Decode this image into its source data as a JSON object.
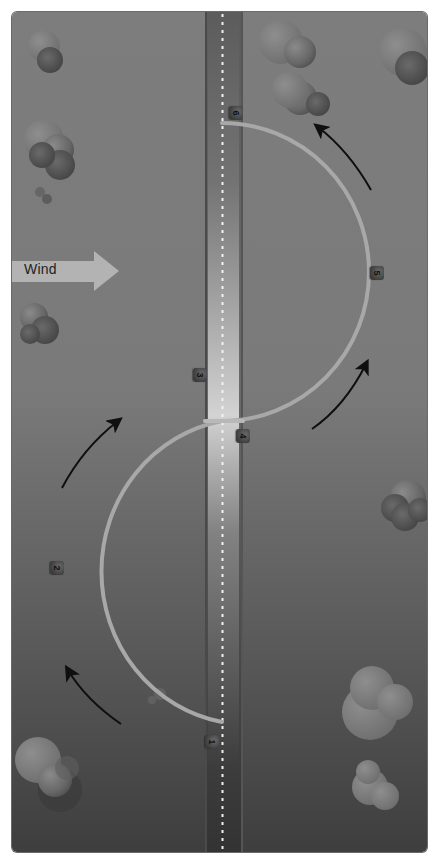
{
  "diagram": {
    "title": "",
    "type": "s-turn-ground-reference-maneuver",
    "wind": {
      "label": "Wind",
      "direction": "left-to-right"
    },
    "reference_line": {
      "kind": "road",
      "center_line": "dashed"
    },
    "positions": [
      {
        "id": 1,
        "label": "1",
        "x": 212,
        "y": 742
      },
      {
        "id": 2,
        "label": "2",
        "x": 57,
        "y": 568
      },
      {
        "id": 3,
        "label": "3",
        "x": 200,
        "y": 375
      },
      {
        "id": 4,
        "label": "4",
        "x": 243,
        "y": 436
      },
      {
        "id": 5,
        "label": "5",
        "x": 377,
        "y": 273
      },
      {
        "id": 6,
        "label": "6",
        "x": 236,
        "y": 113
      }
    ],
    "flight_path": {
      "segments": [
        {
          "name": "lower-semicircle",
          "side": "left",
          "from_position": 1,
          "to_position": 3
        },
        {
          "name": "upper-semicircle",
          "side": "right",
          "from_position": 4,
          "to_position": 6
        }
      ]
    },
    "direction_arrows": [
      {
        "name": "arrow-lower-left-bottom",
        "from": [
          120,
          724
        ],
        "to": [
          66,
          668
        ]
      },
      {
        "name": "arrow-lower-left-top",
        "from": [
          62,
          487
        ],
        "to": [
          120,
          420
        ]
      },
      {
        "name": "arrow-upper-right-bottom",
        "from": [
          313,
          428
        ],
        "to": [
          368,
          362
        ]
      },
      {
        "name": "arrow-upper-right-top",
        "from": [
          371,
          190
        ],
        "to": [
          315,
          125
        ]
      }
    ],
    "icons": [
      "tree-icon",
      "arrow-icon",
      "wind-arrow-icon",
      "road-icon"
    ],
    "colors": {
      "ground_top": "#7d7d7d",
      "ground_bottom": "#3e3e3e",
      "road": "#5e5e5e",
      "road_highlight": "#bcbcbc",
      "path": "#a8a8a8",
      "wind_arrow": "#b3b3b3",
      "direction_arrow": "#0f0f0f",
      "tree": "#6b6b6b"
    }
  }
}
